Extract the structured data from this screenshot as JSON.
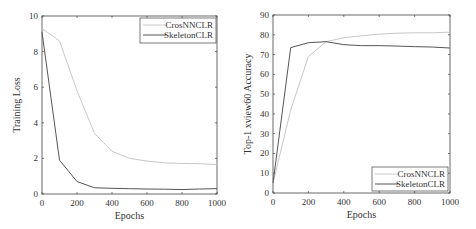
{
  "chart_data": [
    {
      "type": "line",
      "title": "",
      "xlabel": "Epochs",
      "ylabel": "Training Loss",
      "xlim": [
        0,
        1000
      ],
      "ylim": [
        0,
        10
      ],
      "xticks": [
        0,
        200,
        400,
        600,
        800,
        1000
      ],
      "yticks": [
        0,
        2,
        4,
        6,
        8,
        10
      ],
      "legend_position": "upper right",
      "grid": false,
      "x": [
        0,
        100,
        200,
        300,
        400,
        500,
        600,
        700,
        800,
        900,
        1000
      ],
      "series": [
        {
          "name": "CrosNNCLR",
          "color": "#c8c8c8",
          "values": [
            9.3,
            8.6,
            5.8,
            3.4,
            2.4,
            2.0,
            1.85,
            1.75,
            1.72,
            1.7,
            1.65
          ]
        },
        {
          "name": "SkeletonCLR",
          "color": "#555555",
          "values": [
            9.1,
            1.9,
            0.7,
            0.35,
            0.32,
            0.3,
            0.28,
            0.27,
            0.25,
            0.28,
            0.3
          ]
        }
      ]
    },
    {
      "type": "line",
      "title": "",
      "xlabel": "Epochs",
      "ylabel": "Top-1 xview60 Accuracy",
      "xlim": [
        0,
        1000
      ],
      "ylim": [
        0,
        90
      ],
      "xticks": [
        0,
        200,
        400,
        600,
        800,
        1000
      ],
      "yticks": [
        0,
        10,
        20,
        30,
        40,
        50,
        60,
        70,
        80,
        90
      ],
      "legend_position": "lower right",
      "grid": false,
      "x": [
        0,
        100,
        200,
        300,
        400,
        500,
        600,
        700,
        800,
        900,
        1000
      ],
      "series": [
        {
          "name": "CrosNNCLR",
          "color": "#c8c8c8",
          "values": [
            5,
            42,
            69,
            76.5,
            78.5,
            79.5,
            80.3,
            80.8,
            81,
            81,
            81.3
          ]
        },
        {
          "name": "SkeletonCLR",
          "color": "#555555",
          "values": [
            5,
            73.5,
            76,
            76.5,
            75,
            74.5,
            74.5,
            74.3,
            74,
            73.8,
            73.3
          ]
        }
      ]
    }
  ]
}
